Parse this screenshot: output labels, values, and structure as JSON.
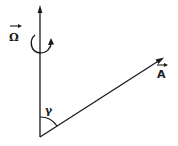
{
  "diagram": {
    "type": "vector-diagram",
    "colors": {
      "stroke": "#1a1a1a",
      "background": "#ffffff"
    },
    "vectors": [
      {
        "name": "Omega",
        "label": "Ω",
        "has_vector_arrow": true,
        "direction": "vertical-up",
        "rotation_indicator": "counterclockwise-arrow-around-axis"
      },
      {
        "name": "A",
        "label": "A",
        "has_vector_arrow": true,
        "direction": "up-right"
      }
    ],
    "angle": {
      "label": "γ",
      "between": [
        "Omega",
        "A"
      ]
    }
  }
}
